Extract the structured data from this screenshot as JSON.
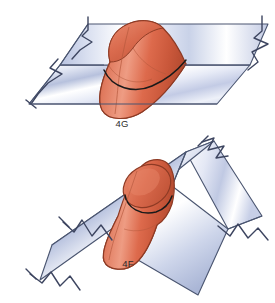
{
  "figure_set": {
    "title": "",
    "background_color": "#ffffff",
    "count": 2
  },
  "palette": {
    "slab_edge": "#4a5570",
    "slab_light": "#ffffff",
    "slab_mid": "#c5cde6",
    "slab_dark": "#9aa6c9",
    "cylinder_light": "#e8836a",
    "cylinder_mid": "#d9654a",
    "cylinder_dark": "#b84c34",
    "cylinder_edge": "#8d3a24",
    "intersection_line": "#1a1a1a",
    "label_color": "#2b2b2b"
  },
  "figures": [
    {
      "id": "fig-4g",
      "label": "4G",
      "description": "Orange cylinder penetrating a horizontal slab at an oblique angle",
      "label_x": 122,
      "label_y": 127,
      "slab": {
        "orientation": "horizontal",
        "break_symbols": 3,
        "break_sides": [
          "left",
          "right"
        ]
      },
      "cylinder": {
        "color": "#d9654a",
        "axis": "oblique",
        "intersection_visible": true
      }
    },
    {
      "id": "fig-4f",
      "label": "4F",
      "description": "Orange cylinder penetrating a diagonally tilted slab",
      "label_x": 128,
      "label_y": 267,
      "slab": {
        "orientation": "diagonal",
        "break_symbols": 3,
        "break_sides": [
          "lower-left",
          "upper-right",
          "right"
        ]
      },
      "cylinder": {
        "color": "#d9654a",
        "axis": "near-vertical",
        "intersection_visible": true
      }
    }
  ]
}
